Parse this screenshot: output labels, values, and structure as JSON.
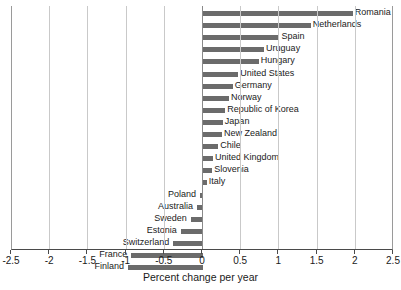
{
  "chart_data": {
    "type": "bar",
    "orientation": "horizontal",
    "title": "",
    "xlabel": "Percent change per year",
    "ylabel": "",
    "xlim": [
      -2.5,
      2.5
    ],
    "xticks": [
      "-2.5",
      "-2",
      "-1.5",
      "-1",
      "-0.5",
      "0",
      "0.5",
      "1",
      "1.5",
      "2",
      "2.5"
    ],
    "xtick_values": [
      -2.5,
      -2,
      -1.5,
      -1,
      -0.5,
      0,
      0.5,
      1,
      1.5,
      2,
      2.5
    ],
    "grid": true,
    "legend": "none",
    "bar_color": "#6b6b6b",
    "categories": [
      "Romania",
      "Netherlands",
      "Spain",
      "Uruguay",
      "Hungary",
      "United States",
      "Germany",
      "Norway",
      "Republic of Korea",
      "Japan",
      "New Zealand",
      "Chile",
      "United Kingdom",
      "Slovenia",
      "Italy",
      "Poland",
      "Australia",
      "Sweden",
      "Estonia",
      "Switzerland",
      "France",
      "Finland"
    ],
    "values": [
      1.96,
      1.41,
      1.0,
      0.8,
      0.73,
      0.46,
      0.39,
      0.34,
      0.29,
      0.26,
      0.25,
      0.2,
      0.13,
      0.12,
      0.05,
      -0.04,
      -0.08,
      -0.16,
      -0.29,
      -0.39,
      -0.94,
      -0.98
    ]
  }
}
